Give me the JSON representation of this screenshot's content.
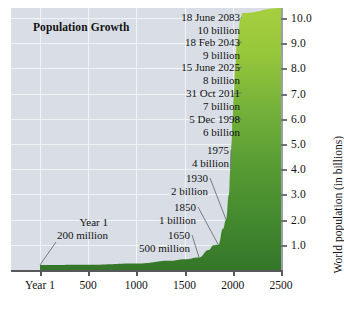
{
  "chart_data": {
    "type": "area",
    "title": "Population Growth",
    "xlabel": "",
    "ylabel": "World population (in billions)",
    "xlim": [
      -300,
      2500
    ],
    "ylim": [
      0,
      10.4
    ],
    "grid": true,
    "legend": "none",
    "x_ticks": [
      {
        "value": 1,
        "label": "Year 1"
      },
      {
        "value": 500,
        "label": "500"
      },
      {
        "value": 1000,
        "label": "1000"
      },
      {
        "value": 1500,
        "label": "1500"
      },
      {
        "value": 2000,
        "label": "2000"
      },
      {
        "value": 2500,
        "label": "2500"
      }
    ],
    "y_ticks": [
      {
        "value": 1,
        "label": "1.0"
      },
      {
        "value": 2,
        "label": "2.0"
      },
      {
        "value": 3,
        "label": "3.0"
      },
      {
        "value": 4,
        "label": "4.0"
      },
      {
        "value": 5,
        "label": "5.0"
      },
      {
        "value": 6,
        "label": "6.0"
      },
      {
        "value": 7,
        "label": "7.0"
      },
      {
        "value": 8,
        "label": "8.0"
      },
      {
        "value": 9,
        "label": "9.0"
      },
      {
        "value": 10,
        "label": "10.0"
      }
    ],
    "x": [
      1,
      500,
      1000,
      1350,
      1500,
      1650,
      1750,
      1800,
      1850,
      1900,
      1930,
      1960,
      1975,
      1987,
      1998,
      2011,
      2025,
      2043,
      2083,
      2100,
      2500
    ],
    "values": [
      0.2,
      0.21,
      0.26,
      0.37,
      0.43,
      0.5,
      0.79,
      0.98,
      1.0,
      1.65,
      2.0,
      3.0,
      4.0,
      5.0,
      6.0,
      7.0,
      8.0,
      9.0,
      10.0,
      10.2,
      10.4
    ],
    "annotations": [
      {
        "date": "18 June 2083",
        "population": "10 billion",
        "x": 2083,
        "y": 10.0
      },
      {
        "date": "18 Feb 2043",
        "population": "9 billion",
        "x": 2043,
        "y": 9.0
      },
      {
        "date": "15 June 2025",
        "population": "8 billion",
        "x": 2025,
        "y": 8.0
      },
      {
        "date": "31 Oct 2011",
        "population": "7 billion",
        "x": 2011,
        "y": 7.0
      },
      {
        "date": "5 Dec 1998",
        "population": "6 billion",
        "x": 1998,
        "y": 6.0
      },
      {
        "date": "1975",
        "population": "4 billion",
        "x": 1975,
        "y": 4.0
      },
      {
        "date": "1930",
        "population": "2 billion",
        "x": 1930,
        "y": 2.0
      },
      {
        "date": "1850",
        "population": "1 billion",
        "x": 1850,
        "y": 1.0
      },
      {
        "date": "1650",
        "population": "500 million",
        "x": 1650,
        "y": 0.5
      },
      {
        "date": "Year 1",
        "population": "200 million",
        "x": 1,
        "y": 0.2
      }
    ],
    "colors": {
      "plot_background": "#d9dee6",
      "gridline": "#f2f4f8",
      "area_top": "#9ccb3b",
      "area_bottom": "#3a7d2c",
      "axis": "#58595b",
      "text": "#111111",
      "leader_line": "#6b7078"
    }
  }
}
